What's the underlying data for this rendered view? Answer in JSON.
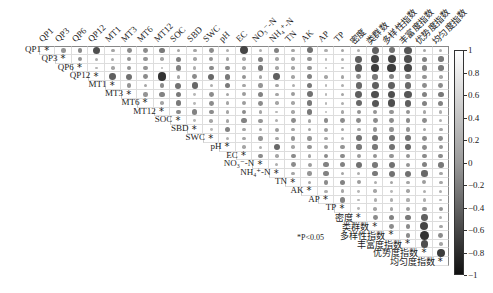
{
  "chart_data": {
    "type": "heatmap",
    "subtype": "correlation-matrix-upper-triangle",
    "title": "",
    "variables": [
      "QP1",
      "QP3",
      "QP6",
      "QP12",
      "MT1",
      "MT3",
      "MT6",
      "MT12",
      "SOC",
      "SBD",
      "SWC",
      "pH",
      "EC",
      "NO₃⁻-N",
      "NH₄⁺-N",
      "TN",
      "AK",
      "AP",
      "TP",
      "密度",
      "类群数",
      "多样性指数",
      "丰富度指数",
      "优势度指数",
      "均匀度指数"
    ],
    "colorbar": {
      "min": -1,
      "max": 1,
      "ticks": [
        1,
        0.8,
        0.6,
        0.4,
        0.2,
        0,
        -0.2,
        -0.4,
        -0.6,
        -0.8,
        -1
      ]
    },
    "significance_note": "*P<0.05",
    "diagonal_marker": "*",
    "legend_position": "right",
    "grid": true,
    "matrix_strength": [
      [
        1,
        0.3,
        0.35,
        0.7,
        0.2,
        0.35,
        0.35,
        0.45,
        0.2,
        0.2,
        0.35,
        0.15,
        0.75,
        0.15,
        0.4,
        0.2,
        0.5,
        0.15,
        0.2,
        0.15,
        0.6,
        0.5,
        0.65,
        0.2,
        0.15
      ],
      [
        0,
        1,
        0.3,
        0.15,
        0.15,
        0.3,
        0.3,
        0.2,
        0.4,
        0.2,
        0.3,
        0.2,
        0.2,
        0.4,
        0.2,
        0.2,
        0.3,
        0.1,
        0.15,
        0.6,
        0.75,
        0.75,
        0.7,
        0.4,
        0.45
      ],
      [
        0,
        0,
        1,
        0.1,
        0.2,
        0.3,
        0.3,
        0.1,
        0.4,
        0.15,
        0.35,
        0.35,
        0.2,
        0.45,
        0.2,
        0.2,
        0.3,
        0.1,
        0.1,
        0.65,
        0.8,
        0.8,
        0.75,
        0.4,
        0.45
      ],
      [
        0,
        0,
        0,
        1,
        0.6,
        0.5,
        0.35,
        0.85,
        0.2,
        0.35,
        0.55,
        0.45,
        0.3,
        0.2,
        0.6,
        0.2,
        0.4,
        0.2,
        0.2,
        0.35,
        0.45,
        0.4,
        0.4,
        0.3,
        0.2
      ],
      [
        0,
        0,
        0,
        0,
        1,
        0.3,
        0.2,
        0.35,
        0.5,
        0.55,
        0.15,
        0.45,
        0.2,
        0.3,
        0.2,
        0.15,
        0.45,
        0.1,
        0.15,
        0.55,
        0.6,
        0.6,
        0.55,
        0.35,
        0.35
      ],
      [
        0,
        0,
        0,
        0,
        0,
        1,
        0.3,
        0.4,
        0.45,
        0.1,
        0.35,
        0.2,
        0.25,
        0.4,
        0.2,
        0.25,
        0.5,
        0.1,
        0.2,
        0.6,
        0.7,
        0.7,
        0.65,
        0.4,
        0.45
      ],
      [
        0,
        0,
        0,
        0,
        0,
        0,
        1,
        0.2,
        0.45,
        0.1,
        0.35,
        0.2,
        0.25,
        0.35,
        0.2,
        0.2,
        0.45,
        0.1,
        0.15,
        0.55,
        0.65,
        0.7,
        0.6,
        0.4,
        0.4
      ],
      [
        0,
        0,
        0,
        0,
        0,
        0,
        0,
        1,
        0.35,
        0.4,
        0.35,
        0.2,
        0.35,
        0.2,
        0.1,
        0.2,
        0.45,
        0.1,
        0.2,
        0.3,
        0.3,
        0.3,
        0.3,
        0.2,
        0.15
      ],
      [
        0,
        0,
        0,
        0,
        0,
        0,
        0,
        0,
        1,
        0.1,
        0.2,
        0.2,
        0.4,
        0.3,
        0.15,
        0.35,
        0.2,
        0.35,
        0.35,
        0.35,
        0.35,
        0.35,
        0.35,
        0.35,
        0.15
      ],
      [
        0,
        0,
        0,
        0,
        0,
        0,
        0,
        0,
        0,
        1,
        0.1,
        0.4,
        0.2,
        0.2,
        0.25,
        0.2,
        0.2,
        0.25,
        0.2,
        0.2,
        0.3,
        0.3,
        0.3,
        0.2,
        0.2
      ],
      [
        0,
        0,
        0,
        0,
        0,
        0,
        0,
        0,
        0,
        0,
        1,
        0.15,
        0.2,
        0.3,
        0.2,
        0.3,
        0.3,
        0.2,
        0.15,
        0.5,
        0.5,
        0.5,
        0.5,
        0.35,
        0.35
      ],
      [
        0,
        0,
        0,
        0,
        0,
        0,
        0,
        0,
        0,
        0,
        0,
        1,
        0.2,
        0.15,
        0.55,
        0.2,
        0.3,
        0.25,
        0.3,
        0.45,
        0.45,
        0.5,
        0.55,
        0.35,
        0.3
      ],
      [
        0,
        0,
        0,
        0,
        0,
        0,
        0,
        0,
        0,
        0,
        0,
        0,
        1,
        0.35,
        0.2,
        0.35,
        0.2,
        0.35,
        0.35,
        0.25,
        0.3,
        0.3,
        0.3,
        0.35,
        0.35
      ],
      [
        0,
        0,
        0,
        0,
        0,
        0,
        0,
        0,
        0,
        0,
        0,
        0,
        0,
        1,
        0.15,
        0.35,
        0.25,
        0.4,
        0.4,
        0.5,
        0.45,
        0.5,
        0.3,
        0.4,
        0.45
      ],
      [
        0,
        0,
        0,
        0,
        0,
        0,
        0,
        0,
        0,
        0,
        0,
        0,
        0,
        0,
        1,
        0.2,
        0.3,
        0.4,
        0.2,
        0.15,
        0.45,
        0.5,
        0.5,
        0.55,
        0.2
      ],
      [
        0,
        0,
        0,
        0,
        0,
        0,
        0,
        0,
        0,
        0,
        0,
        0,
        0,
        0,
        0,
        1,
        0.2,
        0.35,
        0.4,
        0.25,
        0.15,
        0.2,
        0.2,
        0.25,
        0.2
      ],
      [
        0,
        0,
        0,
        0,
        0,
        0,
        0,
        0,
        0,
        0,
        0,
        0,
        0,
        0,
        0,
        0,
        1,
        0.15,
        0.2,
        0.1,
        0.2,
        0.1,
        0.2,
        0.15,
        0.15
      ],
      [
        0,
        0,
        0,
        0,
        0,
        0,
        0,
        0,
        0,
        0,
        0,
        0,
        0,
        0,
        0,
        0,
        0,
        1,
        0.4,
        0.1,
        0.15,
        0.15,
        0.15,
        0.15,
        0.1
      ],
      [
        0,
        0,
        0,
        0,
        0,
        0,
        0,
        0,
        0,
        0,
        0,
        0,
        0,
        0,
        0,
        0,
        0,
        0,
        1,
        0.1,
        0.2,
        0.2,
        0.25,
        0.3,
        0.3
      ],
      [
        0,
        0,
        0,
        0,
        0,
        0,
        0,
        0,
        0,
        0,
        0,
        0,
        0,
        0,
        0,
        0,
        0,
        0,
        0,
        1,
        0.35,
        0.4,
        0.45,
        0.6,
        0.15
      ],
      [
        0,
        0,
        0,
        0,
        0,
        0,
        0,
        0,
        0,
        0,
        0,
        0,
        0,
        0,
        0,
        0,
        0,
        0,
        0,
        0,
        1,
        0.35,
        0.35,
        0.75,
        0.2
      ],
      [
        0,
        0,
        0,
        0,
        0,
        0,
        0,
        0,
        0,
        0,
        0,
        0,
        0,
        0,
        0,
        0,
        0,
        0,
        0,
        0,
        0,
        1,
        0.35,
        0.85,
        0.35
      ],
      [
        0,
        0,
        0,
        0,
        0,
        0,
        0,
        0,
        0,
        0,
        0,
        0,
        0,
        0,
        0,
        0,
        0,
        0,
        0,
        0,
        0,
        0,
        1,
        0.7,
        0.2
      ],
      [
        0,
        0,
        0,
        0,
        0,
        0,
        0,
        0,
        0,
        0,
        0,
        0,
        0,
        0,
        0,
        0,
        0,
        0,
        0,
        0,
        0,
        0,
        0,
        1,
        0.8
      ],
      [
        0,
        0,
        0,
        0,
        0,
        0,
        0,
        0,
        0,
        0,
        0,
        0,
        0,
        0,
        0,
        0,
        0,
        0,
        0,
        0,
        0,
        0,
        0,
        0,
        1
      ]
    ]
  },
  "labels": {
    "significance": "*P<0.05"
  }
}
